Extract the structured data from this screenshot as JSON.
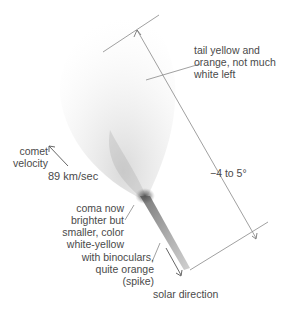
{
  "diagram": {
    "labels": {
      "tail": [
        "tail yellow and",
        "orange, not much",
        "white left"
      ],
      "velocity": [
        "comet",
        "velocity"
      ],
      "speed": "89 km/sec",
      "angle": "−4 to 5°",
      "coma": [
        "coma now",
        "brighter but",
        "smaller, color",
        "white-yellow"
      ],
      "spike": [
        "with binoculars,",
        "quite orange",
        "(spike)"
      ],
      "solar": "solar direction"
    },
    "colors": {
      "line": "#888888",
      "text": "#4a4a4a",
      "comet": "#555555"
    }
  }
}
